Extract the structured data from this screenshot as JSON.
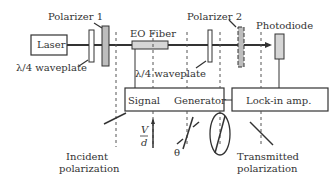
{
  "components": {
    "laser": "Laser",
    "polarizer1": "Polarizer 1",
    "waveplate1": "λ/4 waveplate",
    "eo_fiber": "EO Fiber",
    "waveplate2": "λ/4 waveplate",
    "polarizer2": "Polarizer 2",
    "photodiode": "Photodiode",
    "signal_generator_left": "Signal",
    "signal_generator_right": "Generator",
    "lockin": "Lock-in amp."
  },
  "annotations": {
    "incident_line1": "Incident",
    "incident_line2": "polarization",
    "transmitted_line1": "Transmitted",
    "transmitted_line2": "polarization",
    "field_numerator": "V",
    "field_denominator": "d",
    "angle_symbol": "θ"
  },
  "colors": {
    "line": "#333333",
    "component_fill": "#bdbdbd",
    "fiber_fill": "#d6d6d6",
    "dashed": "#555555"
  }
}
